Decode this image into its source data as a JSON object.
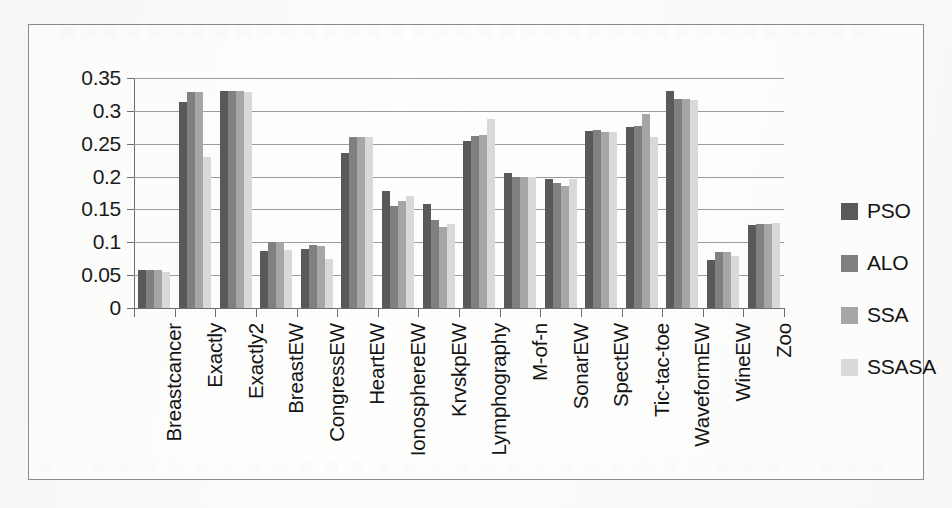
{
  "chart_data": {
    "type": "bar",
    "title": "",
    "subtitle": "",
    "xlabel": "",
    "ylabel": "",
    "ylim": [
      0,
      0.35
    ],
    "ytick_values": [
      0,
      0.05,
      0.1,
      0.15,
      0.2,
      0.25,
      0.3,
      0.35
    ],
    "ytick_labels": [
      "0",
      "0.05",
      "0.1",
      "0.15",
      "0.2",
      "0.25",
      "0.3",
      "0.35"
    ],
    "grid": "horizontal",
    "legend_position": "right",
    "categories": [
      "Breastcancer",
      "Exactly",
      "Exactly2",
      "BreastEW",
      "CongressEW",
      "HeartEW",
      "IonosphereEW",
      "KrvskpEW",
      "Lymphography",
      "M-of-n",
      "SonarEW",
      "SpectEW",
      "Tic-tac-toe",
      "WaveformEW",
      "WineEW",
      "Zoo"
    ],
    "series": [
      {
        "name": "PSO",
        "color": "#595959",
        "values": [
          0.058,
          0.313,
          0.33,
          0.087,
          0.09,
          0.236,
          0.178,
          0.159,
          0.254,
          0.205,
          0.196,
          0.27,
          0.275,
          0.331,
          0.073,
          0.127
        ]
      },
      {
        "name": "ALO",
        "color": "#808080",
        "values": [
          0.058,
          0.328,
          0.331,
          0.1,
          0.096,
          0.261,
          0.155,
          0.134,
          0.262,
          0.2,
          0.19,
          0.271,
          0.277,
          0.318,
          0.086,
          0.128
        ]
      },
      {
        "name": "SSA",
        "color": "#a6a6a6",
        "values": [
          0.058,
          0.328,
          0.33,
          0.1,
          0.094,
          0.261,
          0.163,
          0.123,
          0.263,
          0.2,
          0.186,
          0.268,
          0.295,
          0.318,
          0.085,
          0.128
        ]
      },
      {
        "name": "SSASA",
        "color": "#d9d9d9",
        "values": [
          0.055,
          0.23,
          0.329,
          0.088,
          0.075,
          0.26,
          0.17,
          0.128,
          0.287,
          0.199,
          0.197,
          0.268,
          0.26,
          0.316,
          0.079,
          0.129
        ]
      }
    ]
  },
  "legend": {
    "items": [
      {
        "label": "PSO",
        "color": "#595959"
      },
      {
        "label": "ALO",
        "color": "#808080"
      },
      {
        "label": "SSA",
        "color": "#a6a6a6"
      },
      {
        "label": "SSASA",
        "color": "#d9d9d9"
      }
    ]
  },
  "colors": {
    "frame": "#8a8a8a",
    "grid": "#9c9c9c",
    "axis": "#6e6e6e",
    "text": "#141414"
  }
}
